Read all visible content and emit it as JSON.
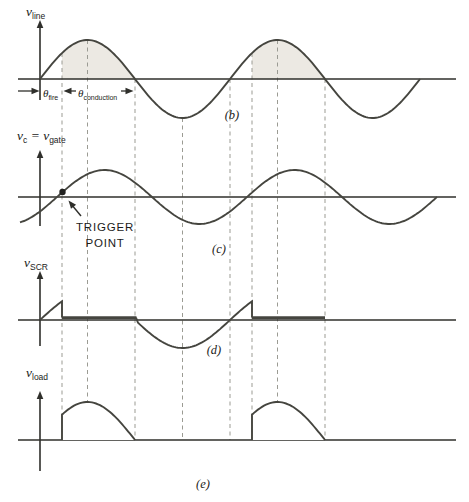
{
  "figure": {
    "kind": "scr-phase-control-waveforms",
    "colors": {
      "background": "#ffffff",
      "ink": "#45453f",
      "axis": "#2f2f2b",
      "dash": "#9b9b93",
      "shade": "#ece9e3",
      "text": "#1b1b19"
    },
    "geometry": {
      "width": 469,
      "height": 502,
      "x_axis_start": 18,
      "x_axis_end": 456,
      "y_axis_x": 40,
      "period": 190,
      "dashes": [
        {
          "x": 62,
          "top": 53
        },
        {
          "x": 87.5,
          "top": 40
        },
        {
          "x": 135,
          "top": 79
        },
        {
          "x": 182.5,
          "top": 118
        },
        {
          "x": 230,
          "top": 79
        },
        {
          "x": 252,
          "top": 53
        },
        {
          "x": 277.5,
          "top": 40
        },
        {
          "x": 325,
          "top": 79
        }
      ],
      "dash_bottom": 440
    },
    "panels": {
      "b": {
        "letter": "(b)",
        "letter_x": 232,
        "letter_y": 119,
        "signal_label": [
          {
            "t": "v",
            "sub": false
          },
          {
            "t": "line",
            "sub": true
          }
        ],
        "label_x": 26,
        "label_y": 16,
        "axis_y": 79,
        "amplitude": 39,
        "phase_x": 40,
        "curve_from": 40,
        "curve_to": 420,
        "yaxis_top": 20,
        "yaxis_bottom": 100,
        "shade_spans": [
          [
            62,
            135
          ],
          [
            252,
            325
          ]
        ],
        "dim": {
          "arrow_y": 91,
          "theta_fire": [
            {
              "t": "θ",
              "sub": false
            },
            {
              "t": "fire",
              "sub": true
            }
          ],
          "theta_fire_x": 43,
          "theta_conduction": [
            {
              "t": "θ",
              "sub": false
            },
            {
              "t": "conduction",
              "sub": true
            }
          ],
          "theta_conduction_x": 78,
          "theta_baseline_y": 97,
          "fire_tip_x": 39.5,
          "fire_tail_x": 18,
          "cond_left_tip_x": 63.5,
          "cond_left_tail_x": 76,
          "cond_right_tip_x": 133.5,
          "cond_right_tail_x": 121
        }
      },
      "c": {
        "letter": "(c)",
        "letter_x": 219,
        "letter_y": 253,
        "signal_label": [
          {
            "t": "v",
            "sub": false
          },
          {
            "t": "c",
            "sub": true
          },
          {
            "t": " = ",
            "sub": false
          },
          {
            "t": "v",
            "sub": false
          },
          {
            "t": "gate",
            "sub": true
          }
        ],
        "label_x": 17,
        "label_y": 140,
        "axis_y": 197,
        "amplitude": 27,
        "phase_x": 57,
        "curve_from": 20,
        "curve_to": 437,
        "yaxis_top": 150,
        "yaxis_bottom": 226,
        "trigger": {
          "dot_x": 62.5,
          "dot_y": 192,
          "dot_r": 3.2,
          "line1": "TRIGGER",
          "line2": "POINT",
          "text_x": 105,
          "line1_y": 231,
          "line2_y": 247,
          "arrow_tail": [
            81,
            216
          ],
          "arrow_tip": [
            68.5,
            200.5
          ]
        }
      },
      "d": {
        "letter": "(d)",
        "letter_x": 214,
        "letter_y": 354,
        "signal_label": [
          {
            "t": "v",
            "sub": false
          },
          {
            "t": "SCR",
            "sub": true
          }
        ],
        "label_x": 24,
        "label_y": 267,
        "axis_y": 320,
        "amplitude": 28,
        "phase_x": 40,
        "yaxis_top": 271,
        "yaxis_bottom": 346,
        "cycle_starts": [
          40,
          230
        ],
        "fire_xs": [
          62,
          252
        ],
        "blocking_ends": [
          135,
          252
        ],
        "on_spans": [
          [
            62,
            136.5
          ],
          [
            252,
            325
          ]
        ],
        "on_state_y": 317.6,
        "neg_half": {
          "from": 136,
          "to": 252
        }
      },
      "e": {
        "letter": "(e)",
        "letter_x": 203,
        "letter_y": 488,
        "signal_label": [
          {
            "t": "v",
            "sub": false
          },
          {
            "t": "load",
            "sub": true
          }
        ],
        "label_x": 26,
        "label_y": 377,
        "axis_y": 440,
        "amplitude": 38,
        "phase_x": 40,
        "yaxis_top": 391,
        "yaxis_bottom": 471,
        "pulse_spans": [
          [
            62,
            135
          ],
          [
            252,
            325
          ]
        ]
      }
    }
  }
}
